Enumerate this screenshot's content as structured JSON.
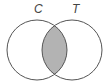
{
  "diagram": {
    "type": "venn",
    "sets": [
      {
        "label": "C",
        "cx": 37,
        "cy": 50,
        "r": 30
      },
      {
        "label": "T",
        "cx": 72,
        "cy": 50,
        "r": 30
      }
    ],
    "shaded_region": "intersection",
    "colors": {
      "stroke": "#555555",
      "shade": "#b3b3b3",
      "background": "#ffffff",
      "label": "#444444"
    }
  }
}
